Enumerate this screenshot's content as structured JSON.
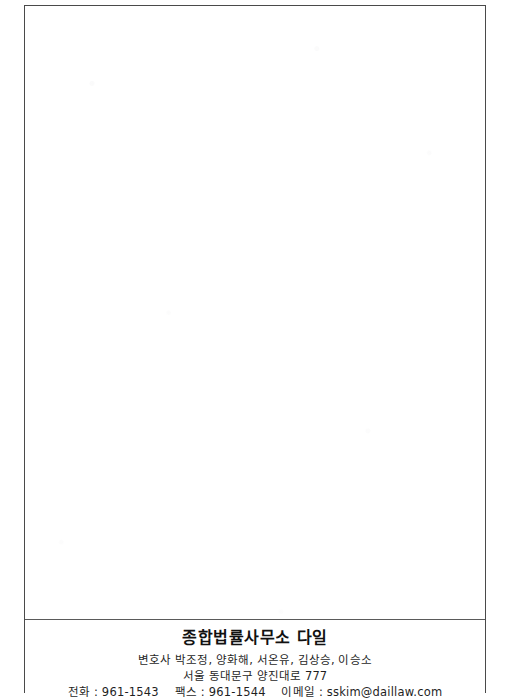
{
  "document": {
    "type": "letterhead-page",
    "body_content": "",
    "page_background": "#ffffff",
    "frame_color": "#4a4a4a",
    "text_color": "#1b1b1b"
  },
  "footer": {
    "firm_name": "종합법률사무소 다일",
    "lawyers_label": "변호사",
    "lawyers": "변호사 박조정, 양화해, 서온유, 김상승, 이승소",
    "address": "서울 동대문구 양진대로 777",
    "phone_label": "전화 :",
    "phone": "961-1543",
    "fax_label": "팩스 :",
    "fax": "961-1544",
    "email_label": "이메일 :",
    "email": "sskim@daillaw.com"
  }
}
